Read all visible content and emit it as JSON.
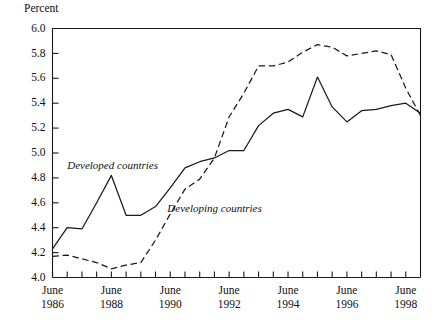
{
  "chart_data": {
    "type": "line",
    "title": "",
    "ylabel": "Percent",
    "xlabel": "",
    "ylim": [
      4.0,
      6.0
    ],
    "ytick_values": [
      4.0,
      4.2,
      4.4,
      4.6,
      4.8,
      5.0,
      5.2,
      5.4,
      5.6,
      5.8,
      6.0
    ],
    "ytick_labels": [
      "4.0",
      "4.2",
      "4.4",
      "4.6",
      "4.8",
      "5.0",
      "5.2",
      "5.4",
      "5.6",
      "5.8",
      "6.0"
    ],
    "xlim": [
      1986.5,
      1999.0
    ],
    "xtick_values": [
      1986.5,
      1987.0,
      1987.5,
      1988.0,
      1988.5,
      1989.0,
      1989.5,
      1990.0,
      1990.5,
      1991.0,
      1991.5,
      1992.0,
      1992.5,
      1993.0,
      1993.5,
      1994.0,
      1994.5,
      1995.0,
      1995.5,
      1996.0,
      1996.5,
      1997.0,
      1997.5,
      1998.0,
      1998.5
    ],
    "xtick_labels": [
      {
        "x": 1986.5,
        "line1": "June",
        "line2": "1986"
      },
      {
        "x": 1988.5,
        "line1": "June",
        "line2": "1988"
      },
      {
        "x": 1990.5,
        "line1": "June",
        "line2": "1990"
      },
      {
        "x": 1992.5,
        "line1": "June",
        "line2": "1992"
      },
      {
        "x": 1994.5,
        "line1": "June",
        "line2": "1994"
      },
      {
        "x": 1996.5,
        "line1": "June",
        "line2": "1996"
      },
      {
        "x": 1998.5,
        "line1": "June",
        "line2": "1998"
      }
    ],
    "grid": false,
    "legend_position": "inline-annotation",
    "series": [
      {
        "name": "Developed countries",
        "style": "solid",
        "color": "#1a1a1a",
        "x": [
          1986.5,
          1987.0,
          1987.5,
          1988.0,
          1988.5,
          1989.0,
          1989.5,
          1990.0,
          1990.5,
          1991.0,
          1991.5,
          1992.0,
          1992.5,
          1993.0,
          1993.5,
          1994.0,
          1994.5,
          1995.0,
          1995.5,
          1996.0,
          1996.5,
          1997.0,
          1997.5,
          1998.0,
          1998.5,
          1999.0
        ],
        "values": [
          4.23,
          4.4,
          4.39,
          4.6,
          4.82,
          4.5,
          4.5,
          4.57,
          4.72,
          4.88,
          4.93,
          4.96,
          5.02,
          5.02,
          5.22,
          5.32,
          5.35,
          5.29,
          5.61,
          5.37,
          5.25,
          5.34,
          5.35,
          5.38,
          5.4,
          5.32
        ]
      },
      {
        "name": "Developing countries",
        "style": "dashed",
        "color": "#1a1a1a",
        "x": [
          1986.5,
          1987.0,
          1987.5,
          1988.0,
          1988.5,
          1989.0,
          1989.5,
          1990.0,
          1990.5,
          1991.0,
          1991.5,
          1992.0,
          1992.5,
          1993.0,
          1993.5,
          1994.0,
          1994.5,
          1995.0,
          1995.5,
          1996.0,
          1996.5,
          1997.0,
          1997.5,
          1998.0,
          1998.5,
          1999.0
        ],
        "values": [
          4.17,
          4.18,
          4.15,
          4.12,
          4.07,
          4.1,
          4.12,
          4.3,
          4.51,
          4.71,
          4.79,
          4.96,
          5.29,
          5.48,
          5.7,
          5.7,
          5.73,
          5.81,
          5.87,
          5.85,
          5.78,
          5.8,
          5.82,
          5.79,
          5.52,
          5.3
        ]
      }
    ],
    "annotations": [
      {
        "name": "developed-countries-label",
        "text": "Developed countries",
        "x": 1987.0,
        "y": 4.87
      },
      {
        "name": "developing-countries-label",
        "text": "Developing countries",
        "x": 1990.4,
        "y": 4.53
      }
    ]
  }
}
